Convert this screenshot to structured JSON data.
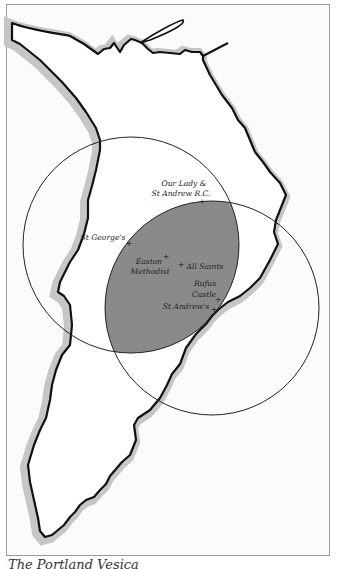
{
  "map": {
    "title": "The Portland Vesica",
    "colors": {
      "frame": "#9a9a9a",
      "sea": "#fbfbfb",
      "land": "#ffffff",
      "coast_shadow": "#c6c6c6",
      "coastline": "#111111",
      "vesica_fill": "#8a8a8a",
      "circle_stroke": "#222222"
    },
    "circles": [
      {
        "name": "north-west-circle",
        "cx": 131,
        "cy": 245,
        "r": 108
      },
      {
        "name": "south-east-circle",
        "cx": 212,
        "cy": 308,
        "r": 107
      }
    ],
    "churches": [
      {
        "name": "Our Lady & St Andrew R.C.",
        "line1": "Our Lady &",
        "line2": "St Andrew R.C.",
        "x": 202,
        "y": 203
      },
      {
        "name": "St George's",
        "line1": "St George's",
        "x": 129,
        "y": 244
      },
      {
        "name": "Easton Methodist",
        "line1": "Easton",
        "line2": "Methodist",
        "x": 166,
        "y": 256
      },
      {
        "name": "All Saints",
        "line1": "All Saints",
        "x": 181,
        "y": 264
      },
      {
        "name": "Rufus Castle",
        "line1": "Rufus",
        "line2": "Castle",
        "x": 218,
        "y": 299
      },
      {
        "name": "St Andrew's",
        "line1": "St Andrew's",
        "x": 214,
        "y": 309
      }
    ]
  }
}
